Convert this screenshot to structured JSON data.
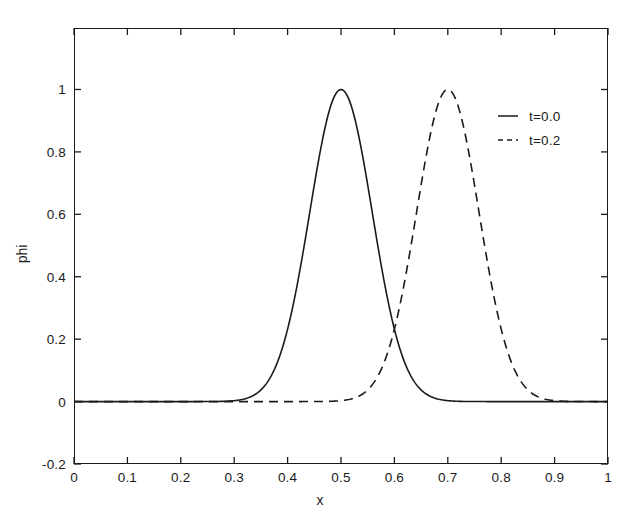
{
  "chart_data": {
    "type": "line",
    "title": "",
    "xlabel": "x",
    "ylabel": "phi",
    "xlim": [
      0,
      1
    ],
    "ylim": [
      -0.2,
      1.197
    ],
    "grid": false,
    "legend_position": "upper right",
    "xticks": [
      0,
      0.1,
      0.2,
      0.3,
      0.4,
      0.5,
      0.6,
      0.7,
      0.8,
      0.9,
      1
    ],
    "xticklabels": [
      "0",
      "0.1",
      "0.2",
      "0.3",
      "0.4",
      "0.5",
      "0.6",
      "0.7",
      "0.8",
      "0.9",
      "1"
    ],
    "yticks": [
      -0.2,
      0,
      0.2,
      0.4,
      0.6,
      0.8,
      1
    ],
    "yticklabels": [
      "-0.2",
      "0",
      "0.2",
      "0.4",
      "0.6",
      "0.8",
      "1"
    ],
    "annotations": [
      "solid curve is a Gaussian pulse centred at x=0.5 with peak phi=1.0",
      "dashed curve is the same pulse advected to x=0.7 with peak phi=1.0",
      "curves intersect near x=0.60, phi=0.37"
    ],
    "series": [
      {
        "name": "t=0.0",
        "label": "t=0.0",
        "linestyle": "solid",
        "color": "#1a1a1a",
        "peak_x": 0.5,
        "peak_y": 1.0,
        "half_width": 0.0585,
        "baseline": 0.0,
        "x": [
          0.0,
          0.05,
          0.1,
          0.15,
          0.2,
          0.25,
          0.27,
          0.29,
          0.31,
          0.33,
          0.35,
          0.37,
          0.39,
          0.41,
          0.43,
          0.45,
          0.47,
          0.49,
          0.5,
          0.51,
          0.53,
          0.55,
          0.57,
          0.59,
          0.61,
          0.63,
          0.65,
          0.67,
          0.69,
          0.71,
          0.73,
          0.75,
          0.8,
          0.85,
          0.9,
          0.95,
          1.0
        ],
        "y": [
          0.0,
          0.0,
          0.0,
          0.0,
          0.001,
          0.005,
          0.01,
          0.02,
          0.038,
          0.069,
          0.118,
          0.192,
          0.294,
          0.424,
          0.574,
          0.729,
          0.868,
          0.97,
          1.0,
          0.993,
          0.924,
          0.8,
          0.645,
          0.484,
          0.34,
          0.224,
          0.138,
          0.08,
          0.043,
          0.022,
          0.011,
          0.005,
          0.001,
          0.0,
          0.0,
          0.0,
          0.0
        ]
      },
      {
        "name": "t=0.2",
        "label": "t=0.2",
        "linestyle": "dashed",
        "color": "#1a1a1a",
        "peak_x": 0.7,
        "peak_y": 1.0,
        "half_width": 0.0585,
        "baseline": 0.0,
        "x": [
          0.0,
          0.05,
          0.1,
          0.15,
          0.2,
          0.25,
          0.3,
          0.35,
          0.4,
          0.45,
          0.47,
          0.49,
          0.51,
          0.53,
          0.55,
          0.57,
          0.59,
          0.61,
          0.63,
          0.65,
          0.67,
          0.69,
          0.7,
          0.71,
          0.73,
          0.75,
          0.77,
          0.79,
          0.81,
          0.83,
          0.85,
          0.87,
          0.89,
          0.91,
          0.95,
          1.0
        ],
        "y": [
          0.0,
          0.0,
          0.0,
          0.0,
          0.0,
          0.001,
          0.002,
          0.004,
          0.008,
          0.018,
          0.025,
          0.038,
          0.057,
          0.085,
          0.125,
          0.18,
          0.253,
          0.345,
          0.455,
          0.574,
          0.729,
          0.924,
          1.0,
          0.993,
          0.88,
          0.729,
          0.574,
          0.424,
          0.294,
          0.192,
          0.118,
          0.069,
          0.038,
          0.02,
          0.005,
          0.001
        ]
      }
    ]
  },
  "legend": {
    "entries": [
      {
        "label": "t=0.0",
        "style": "solid"
      },
      {
        "label": "t=0.2",
        "style": "dashed"
      }
    ]
  },
  "axes": {
    "x_title": "x",
    "y_title": "phi"
  }
}
